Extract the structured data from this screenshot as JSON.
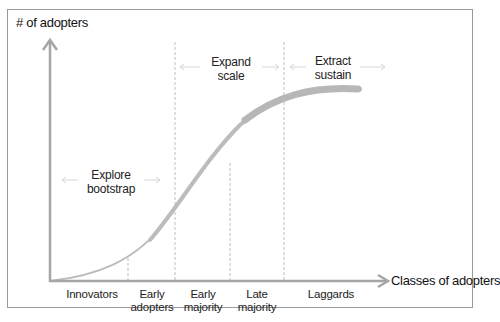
{
  "diagram": {
    "y_axis_label": "# of adopters",
    "x_axis_label": "Classes of adopters",
    "phases": [
      {
        "line1": "Explore",
        "line2": "bootstrap"
      },
      {
        "line1": "Expand",
        "line2": "scale"
      },
      {
        "line1": "Extract",
        "line2": "sustain"
      }
    ],
    "categories": [
      {
        "line1": "Innovators",
        "line2": ""
      },
      {
        "line1": "Early",
        "line2": "adopters"
      },
      {
        "line1": "Early",
        "line2": "majority"
      },
      {
        "line1": "Late",
        "line2": "majority"
      },
      {
        "line1": "Laggards",
        "line2": ""
      }
    ],
    "colors": {
      "axis": "#a6a6a6",
      "curve": "#b9b9b9",
      "dashed": "#bdbdbd",
      "frame": "#9a9a9a",
      "text": "#222222"
    }
  }
}
